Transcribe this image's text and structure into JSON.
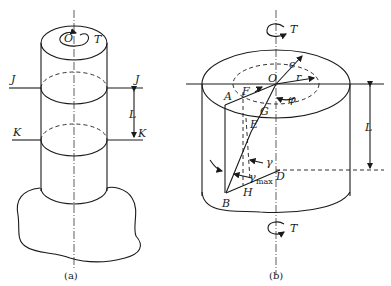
{
  "figure_a": {
    "caption": "(a)",
    "labels": {
      "center": "O",
      "torque": "T",
      "section_top_left": "J",
      "section_top_right": "J",
      "section_bottom_left": "K",
      "section_bottom_right": "K",
      "length": "L"
    }
  },
  "figure_b": {
    "caption": "(b)",
    "labels": {
      "torque_top": "T",
      "torque_bottom": "T",
      "center": "O",
      "outer_radius": "c",
      "inner_radius": "r",
      "angle_phi": "φ",
      "point_A": "A",
      "point_F": "F",
      "point_G": "G",
      "point_E": "E",
      "point_B": "B",
      "point_H": "H",
      "point_D": "D",
      "gamma": "γ",
      "gamma_max": "γ",
      "gamma_max_sub": "max",
      "length": "L"
    }
  },
  "colors": {
    "ink": "#1a1a1a",
    "background": "#ffffff"
  }
}
